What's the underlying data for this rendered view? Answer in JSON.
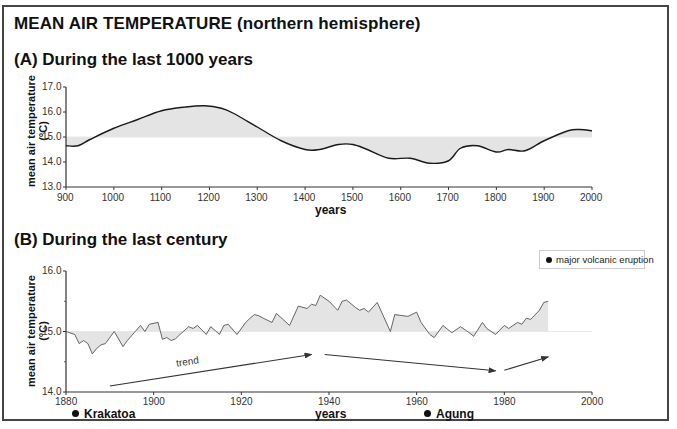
{
  "title": "MEAN AIR TEMPERATURE (northern hemisphere)",
  "panels": {
    "a": {
      "subtitle": "(A) During the last 1000 years",
      "ylabel_line1": "mean air temperature",
      "ylabel_line2": "(°C)",
      "xlabel": "years",
      "yticks": [
        "17.0",
        "16.0",
        "15.0",
        "14.0",
        "13.0"
      ],
      "xticks": [
        "900",
        "1000",
        "1100",
        "1200",
        "1300",
        "1400",
        "1500",
        "1600",
        "1700",
        "1800",
        "1900",
        "2000"
      ]
    },
    "b": {
      "subtitle": "(B) During the last century",
      "ylabel_line1": "mean air temperature",
      "ylabel_line2": "(°C)",
      "xlabel": "years",
      "yticks": [
        "16.0",
        "15.0",
        "14.0"
      ],
      "xticks": [
        "1880",
        "1900",
        "1920",
        "1940",
        "1960",
        "1980",
        "2000"
      ],
      "trend_label": "trend",
      "legend_label": "major volcanic eruption",
      "eruptions": [
        {
          "name": "Krakatoa",
          "year": 1883
        },
        {
          "name": "Agung",
          "year": 1963
        }
      ]
    }
  },
  "colors": {
    "line": "#1a1a1a",
    "line_b": "#555555",
    "fill": "#e4e4e4",
    "baseline": "#e8e8e8",
    "frame": "#444444"
  },
  "chart_data": [
    {
      "type": "line",
      "title": "(A) During the last 1000 years",
      "xlabel": "years",
      "ylabel": "mean air temperature (°C)",
      "xlim": [
        900,
        2000
      ],
      "ylim": [
        13.0,
        17.0
      ],
      "baseline": 15.0,
      "grid": false,
      "x": [
        900,
        925,
        950,
        1000,
        1050,
        1100,
        1150,
        1190,
        1225,
        1250,
        1300,
        1350,
        1400,
        1430,
        1470,
        1500,
        1530,
        1575,
        1620,
        1660,
        1700,
        1725,
        1760,
        1800,
        1825,
        1860,
        1900,
        1950,
        1975,
        2000
      ],
      "values": [
        14.65,
        14.65,
        14.9,
        15.35,
        15.7,
        16.05,
        16.2,
        16.25,
        16.15,
        15.95,
        15.4,
        14.85,
        14.5,
        14.5,
        14.7,
        14.7,
        14.5,
        14.15,
        14.15,
        13.95,
        14.05,
        14.55,
        14.65,
        14.4,
        14.5,
        14.45,
        14.85,
        15.25,
        15.3,
        15.25
      ]
    },
    {
      "type": "line",
      "title": "(B) During the last century",
      "xlabel": "years",
      "ylabel": "mean air temperature (°C)",
      "xlim": [
        1880,
        2000
      ],
      "ylim": [
        14.0,
        16.0
      ],
      "baseline": 15.0,
      "grid": false,
      "legend": [
        "major volcanic eruption"
      ],
      "annotations": [
        "Krakatoa (1883)",
        "Agung (1963)",
        "trend"
      ],
      "x": [
        1880,
        1882,
        1883,
        1884,
        1885,
        1886,
        1887,
        1888,
        1889,
        1891,
        1893,
        1894,
        1897,
        1898,
        1899,
        1901,
        1902,
        1903,
        1904,
        1905,
        1906,
        1908,
        1909,
        1910,
        1912,
        1913,
        1914,
        1915,
        1916,
        1917,
        1919,
        1921,
        1922,
        1923,
        1924,
        1925,
        1927,
        1928,
        1931,
        1933,
        1935,
        1936,
        1937,
        1938,
        1940,
        1942,
        1943,
        1944,
        1946,
        1947,
        1948,
        1949,
        1951,
        1954,
        1955,
        1958,
        1960,
        1961,
        1963,
        1964,
        1966,
        1968,
        1970,
        1972,
        1973,
        1975,
        1976,
        1978,
        1980,
        1981,
        1983,
        1984,
        1985,
        1986,
        1988,
        1989,
        1990
      ],
      "values": [
        15.0,
        14.95,
        14.8,
        14.85,
        14.8,
        14.63,
        14.72,
        14.78,
        14.8,
        15.0,
        14.75,
        14.85,
        15.1,
        15.0,
        15.12,
        15.15,
        14.87,
        14.9,
        14.85,
        14.88,
        14.95,
        15.08,
        15.05,
        15.1,
        14.95,
        15.08,
        15.02,
        14.95,
        15.1,
        15.12,
        14.95,
        15.15,
        15.22,
        15.28,
        15.26,
        15.22,
        15.15,
        15.3,
        15.1,
        15.42,
        15.38,
        15.45,
        15.43,
        15.6,
        15.5,
        15.35,
        15.5,
        15.52,
        15.4,
        15.35,
        15.38,
        15.32,
        15.48,
        15.0,
        15.28,
        15.25,
        15.32,
        15.15,
        14.95,
        14.9,
        15.1,
        14.98,
        15.08,
        14.98,
        14.92,
        15.15,
        15.05,
        14.95,
        15.1,
        15.05,
        15.15,
        15.12,
        15.22,
        15.2,
        15.35,
        15.48,
        15.5
      ],
      "trend_arrows": [
        {
          "from": [
            1890,
            14.1
          ],
          "to": [
            1936,
            14.62
          ]
        },
        {
          "from": [
            1939,
            14.62
          ],
          "to": [
            1978,
            14.35
          ]
        },
        {
          "from": [
            1980,
            14.36
          ],
          "to": [
            1990,
            14.58
          ]
        }
      ]
    }
  ]
}
